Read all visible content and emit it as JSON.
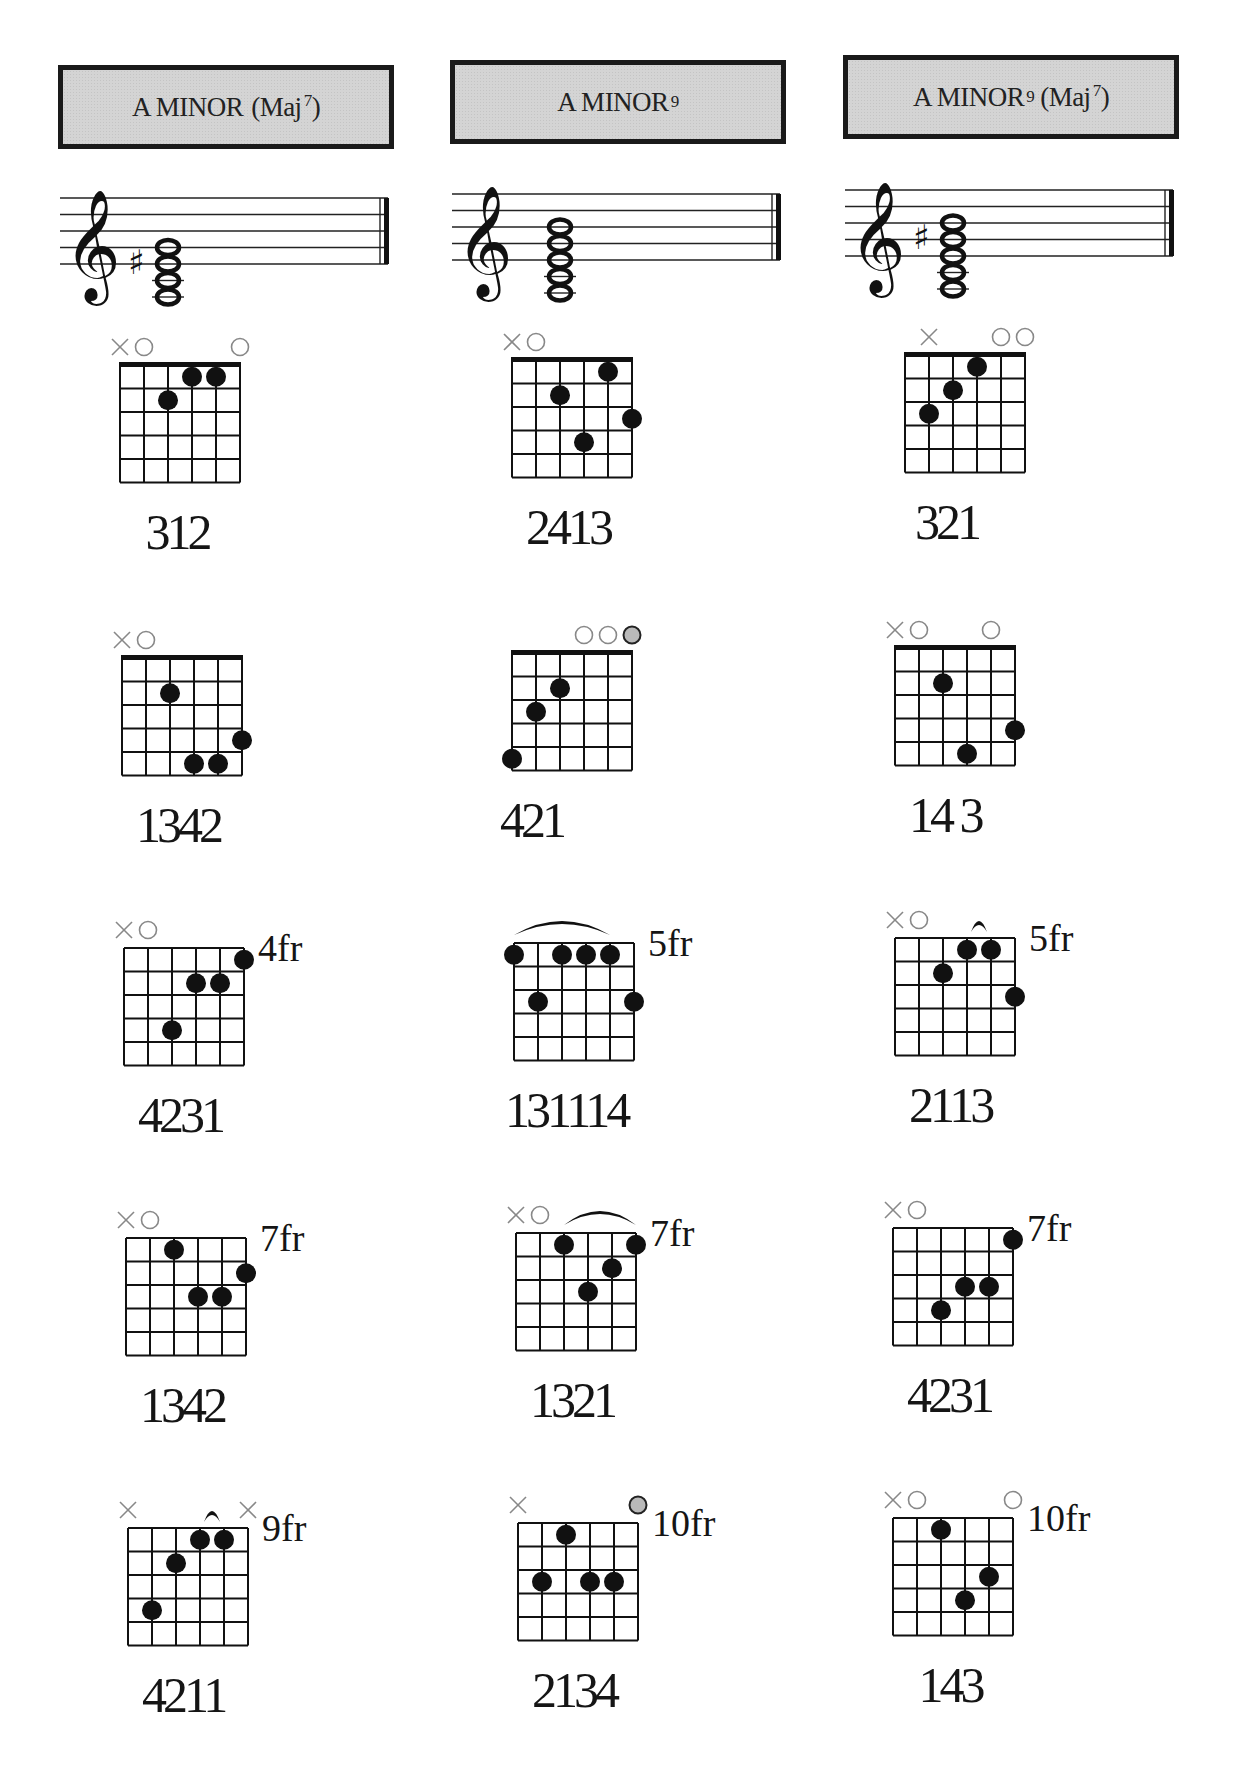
{
  "page": {
    "background": "#ffffff",
    "header_fill": "#d4d4d4",
    "optional_dot_color": "#b9b9b9"
  },
  "columns": [
    {
      "id": "am-maj7",
      "title": {
        "main": "A MINOR",
        "superscript": "",
        "paren_prefix": "(Maj",
        "paren_sup": "7",
        "paren_suffix": ")"
      },
      "staff": {
        "accidental": "♯",
        "notes": 4,
        "sharp_on": "lowest-top"
      },
      "diagrams": [
        {
          "fingering": "312",
          "fret_label": "",
          "nut": true,
          "markers": [
            "x",
            "o",
            "",
            "",
            "",
            "o"
          ],
          "dots": [
            [
              3,
              2
            ],
            [
              4,
              1
            ],
            [
              5,
              1
            ]
          ],
          "optional": [],
          "barre": null
        },
        {
          "fingering": "1342",
          "fret_label": "",
          "nut": true,
          "markers": [
            "x",
            "o",
            "",
            "",
            "",
            ""
          ],
          "dots": [
            [
              3,
              2
            ],
            [
              4,
              5
            ],
            [
              5,
              5
            ],
            [
              6,
              4
            ]
          ],
          "optional": [],
          "barre": null
        },
        {
          "fingering": "4231",
          "fret_label": "4fr",
          "nut": false,
          "markers": [
            "x",
            "o",
            "",
            "",
            "",
            ""
          ],
          "dots": [
            [
              3,
              4
            ],
            [
              4,
              2
            ],
            [
              5,
              2
            ],
            [
              6,
              1
            ]
          ],
          "optional": [],
          "barre": null
        },
        {
          "fingering": "1342",
          "fret_label": "7fr",
          "nut": false,
          "markers": [
            "x",
            "o",
            "",
            "",
            "",
            ""
          ],
          "dots": [
            [
              3,
              1
            ],
            [
              4,
              3
            ],
            [
              5,
              3
            ],
            [
              6,
              2
            ]
          ],
          "optional": [],
          "barre": null
        },
        {
          "fingering": "4211",
          "fret_label": "9fr",
          "nut": false,
          "markers": [
            "x",
            "",
            "",
            "",
            "",
            "x"
          ],
          "dots": [
            [
              2,
              4
            ],
            [
              3,
              2
            ],
            [
              4,
              1
            ],
            [
              5,
              1
            ]
          ],
          "optional": [],
          "barre": {
            "from": 4,
            "to": 5,
            "type": "small"
          }
        }
      ]
    },
    {
      "id": "am9",
      "title": {
        "main": "A MINOR",
        "superscript": "9",
        "paren_prefix": "",
        "paren_sup": "",
        "paren_suffix": ""
      },
      "staff": {
        "accidental": "",
        "notes": 5
      },
      "diagrams": [
        {
          "fingering": "2413",
          "fret_label": "",
          "nut": true,
          "markers": [
            "x",
            "o",
            "",
            "",
            "",
            ""
          ],
          "dots": [
            [
              3,
              2
            ],
            [
              4,
              4
            ],
            [
              5,
              1
            ],
            [
              6,
              3
            ]
          ],
          "optional": [],
          "barre": null
        },
        {
          "fingering": "421",
          "fret_label": "",
          "nut": true,
          "markers": [
            "",
            "",
            "",
            "o",
            "o",
            "g"
          ],
          "dots": [
            [
              1,
              5
            ],
            [
              2,
              3
            ],
            [
              3,
              2
            ]
          ],
          "optional": [
            6
          ],
          "barre": null
        },
        {
          "fingering": "131114",
          "fret_label": "5fr",
          "nut": false,
          "markers": [
            "",
            "",
            "",
            "",
            "",
            ""
          ],
          "dots": [
            [
              1,
              1
            ],
            [
              2,
              3
            ],
            [
              3,
              1
            ],
            [
              4,
              1
            ],
            [
              5,
              1
            ],
            [
              6,
              3
            ]
          ],
          "optional": [],
          "barre": {
            "from": 1,
            "to": 5,
            "type": "arc"
          }
        },
        {
          "fingering": "1321",
          "fret_label": "7fr",
          "nut": false,
          "markers": [
            "x",
            "o",
            "",
            "",
            "",
            ""
          ],
          "dots": [
            [
              3,
              1
            ],
            [
              4,
              3
            ],
            [
              5,
              2
            ],
            [
              6,
              1
            ]
          ],
          "optional": [],
          "barre": {
            "from": 3,
            "to": 6,
            "type": "arc"
          }
        },
        {
          "fingering": "2134",
          "fret_label": "10fr",
          "nut": false,
          "markers": [
            "x",
            "",
            "",
            "",
            "",
            "g"
          ],
          "dots": [
            [
              2,
              3
            ],
            [
              3,
              1
            ],
            [
              4,
              3
            ],
            [
              5,
              3
            ]
          ],
          "optional": [
            6
          ],
          "barre": null
        }
      ]
    },
    {
      "id": "am9-maj7",
      "title": {
        "main": "A MINOR",
        "superscript": "9",
        "paren_prefix": "(Maj",
        "paren_sup": "7",
        "paren_suffix": ")"
      },
      "staff": {
        "accidental": "♯",
        "notes": 5
      },
      "diagrams": [
        {
          "fingering": "321",
          "fret_label": "",
          "nut": true,
          "markers": [
            "",
            "x",
            "",
            "",
            "o",
            "o"
          ],
          "dots": [
            [
              2,
              3
            ],
            [
              3,
              2
            ],
            [
              4,
              1
            ]
          ],
          "optional": [],
          "barre": null
        },
        {
          "fingering": "14 3",
          "fret_label": "",
          "nut": true,
          "markers": [
            "x",
            "o",
            "",
            "",
            "o",
            ""
          ],
          "dots": [
            [
              3,
              2
            ],
            [
              4,
              5
            ],
            [
              6,
              4
            ]
          ],
          "optional": [],
          "barre": null
        },
        {
          "fingering": "2113",
          "fret_label": "5fr",
          "nut": false,
          "markers": [
            "x",
            "o",
            "",
            "",
            "",
            ""
          ],
          "dots": [
            [
              3,
              2
            ],
            [
              4,
              1
            ],
            [
              5,
              1
            ],
            [
              6,
              3
            ]
          ],
          "optional": [],
          "barre": {
            "from": 4,
            "to": 5,
            "type": "small"
          }
        },
        {
          "fingering": "4231",
          "fret_label": "7fr",
          "nut": false,
          "markers": [
            "x",
            "o",
            "",
            "",
            "",
            ""
          ],
          "dots": [
            [
              3,
              4
            ],
            [
              4,
              3
            ],
            [
              5,
              3
            ],
            [
              6,
              1
            ]
          ],
          "optional": [],
          "barre": null
        },
        {
          "fingering": "143",
          "fret_label": "10fr",
          "nut": false,
          "markers": [
            "x",
            "o",
            "",
            "",
            "",
            "o"
          ],
          "dots": [
            [
              3,
              1
            ],
            [
              4,
              4
            ],
            [
              5,
              3
            ]
          ],
          "optional": [],
          "barre": null
        }
      ]
    }
  ]
}
